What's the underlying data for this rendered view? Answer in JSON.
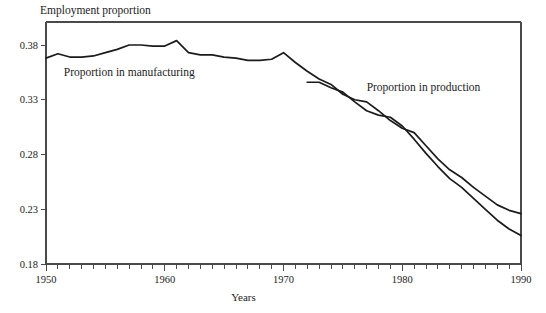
{
  "chart_data": {
    "type": "line",
    "title": "Employment proportion",
    "xlabel": "Years",
    "ylabel": "Employment proportion",
    "xlim": [
      1950,
      1990
    ],
    "ylim": [
      0.18,
      0.4
    ],
    "grid": false,
    "legend_position": "inline-annotations",
    "xticks": [
      1950,
      1960,
      1970,
      1980,
      1990
    ],
    "xtick_labels": [
      "1950",
      "1960",
      "1970",
      "1980",
      "1990"
    ],
    "xtick_minor_interval": 1,
    "yticks": [
      0.18,
      0.23,
      0.28,
      0.33,
      0.38
    ],
    "ytick_labels": [
      "0.18",
      "0.23",
      "0.28",
      "0.33",
      "0.38"
    ],
    "annotations": [
      {
        "text": "Proportion in manufacturing",
        "x": 1951.5,
        "y": 0.352
      },
      {
        "text": "Proportion in production",
        "x": 1977.0,
        "y": 0.338
      }
    ],
    "series": [
      {
        "name": "Proportion in manufacturing",
        "x": [
          1950,
          1951,
          1952,
          1953,
          1954,
          1955,
          1956,
          1957,
          1958,
          1959,
          1960,
          1961,
          1962,
          1963,
          1964,
          1965,
          1966,
          1967,
          1968,
          1969,
          1970,
          1971,
          1972,
          1973,
          1974,
          1975,
          1976,
          1977,
          1978,
          1979,
          1980,
          1981,
          1982,
          1983,
          1984,
          1985,
          1986,
          1987,
          1988,
          1989,
          1990
        ],
        "values": [
          0.368,
          0.372,
          0.369,
          0.369,
          0.37,
          0.373,
          0.376,
          0.38,
          0.38,
          0.379,
          0.379,
          0.384,
          0.373,
          0.371,
          0.371,
          0.369,
          0.368,
          0.366,
          0.366,
          0.367,
          0.373,
          0.364,
          0.356,
          0.349,
          0.344,
          0.335,
          0.33,
          0.328,
          0.32,
          0.311,
          0.304,
          0.3,
          0.288,
          0.276,
          0.266,
          0.259,
          0.25,
          0.242,
          0.234,
          0.229,
          0.226
        ]
      },
      {
        "name": "Proportion in production",
        "x": [
          1972,
          1973,
          1974,
          1975,
          1976,
          1977,
          1978,
          1979,
          1980,
          1981,
          1982,
          1983,
          1984,
          1985,
          1986,
          1987,
          1988,
          1989,
          1990
        ],
        "values": [
          0.346,
          0.346,
          0.341,
          0.337,
          0.328,
          0.32,
          0.316,
          0.314,
          0.306,
          0.294,
          0.281,
          0.269,
          0.258,
          0.25,
          0.24,
          0.23,
          0.22,
          0.212,
          0.206
        ]
      }
    ]
  }
}
